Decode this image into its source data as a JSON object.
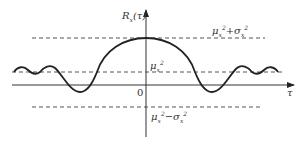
{
  "diagram": {
    "y_axis_label": "R",
    "y_axis_label_sub": "x",
    "y_axis_label_arg": "(τ)",
    "x_axis_label": "τ",
    "origin_label": "0",
    "levels": {
      "upper": {
        "mu": "μ",
        "mu_sub": "x",
        "mu_sup": "2",
        "op": "+",
        "sigma": "σ",
        "sigma_sub": "x",
        "sigma_sup": "2"
      },
      "mean_sq": {
        "mu": "μ",
        "mu_sub": "x",
        "mu_sup": "2"
      },
      "lower": {
        "mu": "μ",
        "mu_sub": "x",
        "mu_sup": "2",
        "op": "−",
        "sigma": "σ",
        "sigma_sub": "x",
        "sigma_sup": "2"
      }
    },
    "colors": {
      "curve": "#222222",
      "axis": "#333333",
      "dashed": "#555555"
    }
  }
}
